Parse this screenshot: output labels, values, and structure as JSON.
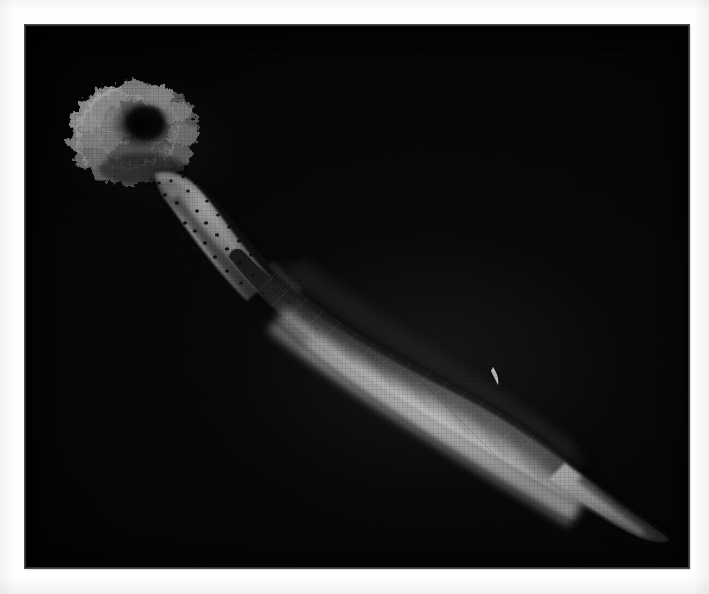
{
  "image": {
    "kind": "photograph",
    "medium": "grayscale halftone plate scan",
    "subject": "marine invertebrate specimen",
    "subject_description": "Elongate soft-bodied invertebrate photographed against a black field; a ruffled, frilly crown of lobed tentacles at the upper left, a narrow papillose neck bearing dark pore-like spots, widening into a smooth fusiform trunk that tapers to a pointed posterior end at the lower right.",
    "orientation": "crown upper-left, posterior tip lower-right",
    "background_color": "#000000",
    "page_color": "#fefefe",
    "border_color": "#4a4a4a",
    "highlight_color": "#d2d2d2",
    "midtone_color": "#8e8e8e",
    "shadow_color": "#242424",
    "canvas": {
      "width": 709,
      "height": 594
    },
    "plate": {
      "x": 25,
      "y": 25,
      "width": 664,
      "height": 543
    }
  },
  "parts": [
    {
      "id": "crown",
      "label": "tentacle crown",
      "description": "ruffled radiating lobes with dark recessed centre",
      "center": {
        "x": 110,
        "y": 128
      },
      "extent": {
        "width": 130,
        "height": 95
      }
    },
    {
      "id": "neck",
      "label": "papillose neck",
      "description": "narrow stalk with scattered dark pores",
      "from": {
        "x": 128,
        "y": 172
      },
      "to": {
        "x": 250,
        "y": 262
      }
    },
    {
      "id": "trunk",
      "label": "fusiform trunk",
      "description": "swollen smooth mid-body, brightest along lower flank",
      "from": {
        "x": 250,
        "y": 262
      },
      "to": {
        "x": 560,
        "y": 450
      }
    },
    {
      "id": "posterior",
      "label": "posterior tip",
      "description": "pointed tapering tail",
      "point": {
        "x": 643,
        "y": 514
      }
    }
  ],
  "markings": {
    "pore_count_visible": 54,
    "pore_color": "#101010",
    "highlight_fleck": {
      "x": 495,
      "y": 376
    }
  },
  "caption": {
    "text": "",
    "visible": false
  }
}
